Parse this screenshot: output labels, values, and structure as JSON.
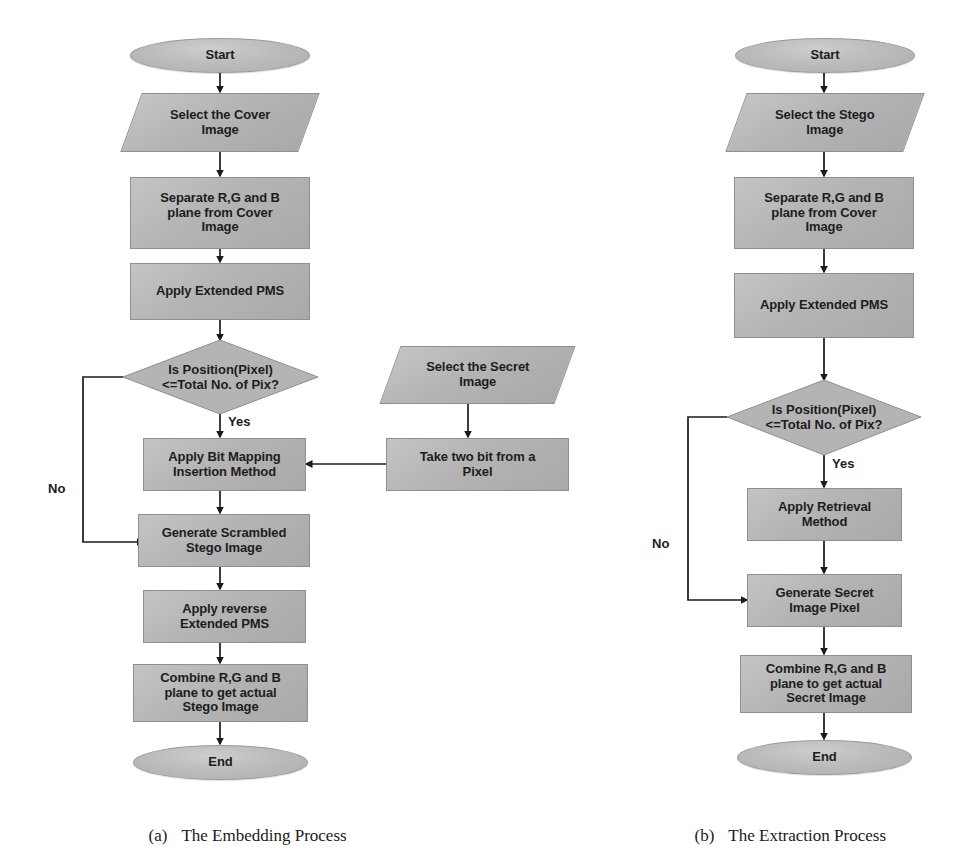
{
  "figure": {
    "background_color": "#ffffff",
    "shape_fill": "#b4b4b4",
    "shape_border": "#8f8f8f",
    "text_color": "#1d1d1d",
    "arrow_color": "#1a1a1a"
  },
  "captions": [
    {
      "tag": "(a)",
      "text": "The Embedding Process"
    },
    {
      "tag": "(b)",
      "text": "The Extraction Process"
    }
  ],
  "embedding": {
    "caption": "The Embedding Process",
    "nodes": {
      "start": "Start",
      "select_cover": "Select the Cover\nImage",
      "separate_planes": "Separate R,G and B\nplane from Cover\nImage",
      "apply_pms": "Apply Extended PMS",
      "decision": "Is Position(Pixel)\n<=Total No. of Pix?",
      "bit_mapping": "Apply Bit Mapping\nInsertion Method",
      "generate_scrambled": "Generate Scrambled\nStego Image",
      "reverse_pms": "Apply reverse\nExtended PMS",
      "combine_planes": "Combine R,G and B\nplane to get actual\nStego Image",
      "end": "End",
      "select_secret": "Select the Secret\nImage",
      "take_two_bit": "Take two bit from a\nPixel"
    },
    "edge_labels": {
      "yes": "Yes",
      "no": "No"
    }
  },
  "extraction": {
    "caption": "The Extraction Process",
    "nodes": {
      "start": "Start",
      "select_stego": "Select the Stego\nImage",
      "separate_planes": "Separate R,G and B\nplane from Cover\nImage",
      "apply_pms": "Apply Extended PMS",
      "decision": "Is Position(Pixel)\n<=Total No. of Pix?",
      "retrieval": "Apply Retrieval\nMethod",
      "generate_secret": "Generate Secret\nImage Pixel",
      "combine_planes": "Combine R,G and B\nplane to get actual\nSecret Image",
      "end": "End"
    },
    "edge_labels": {
      "yes": "Yes",
      "no": "No"
    }
  }
}
